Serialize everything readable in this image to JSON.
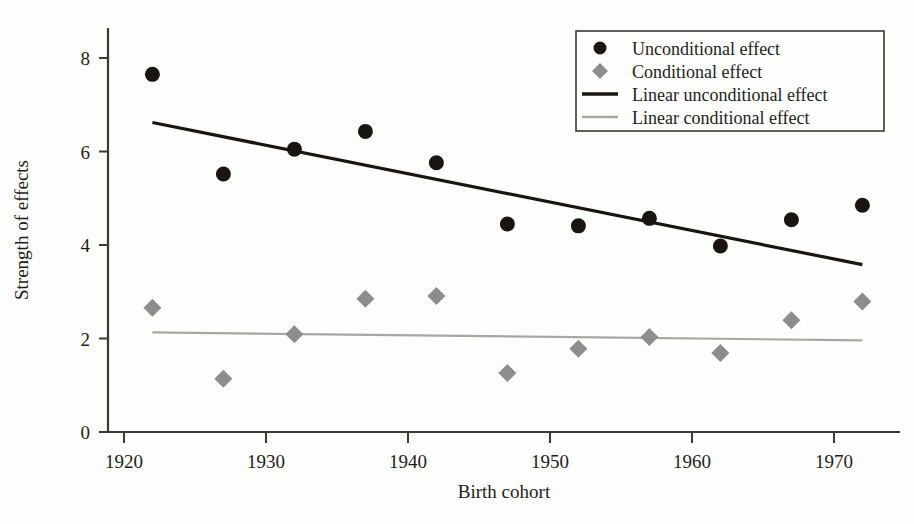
{
  "chart_data": {
    "type": "scatter",
    "title": "",
    "xlabel": "Birth cohort",
    "ylabel": "Strength of effects",
    "xlim": [
      1917,
      1975
    ],
    "ylim": [
      0,
      8.9
    ],
    "xticks": [
      "1920",
      "1930",
      "1940",
      "1950",
      "1960",
      "1970"
    ],
    "xtick_values": [
      1920,
      1930,
      1940,
      1950,
      1960,
      1970
    ],
    "yticks": [
      "0",
      "2",
      "4",
      "6",
      "8"
    ],
    "ytick_values": [
      0,
      2,
      4,
      6,
      8
    ],
    "grid": false,
    "legend_position": "top-right",
    "x": [
      1922,
      1927,
      1932,
      1937,
      1942,
      1947,
      1952,
      1957,
      1962,
      1967,
      1972
    ],
    "series": [
      {
        "name": "Unconditional effect",
        "marker": "circle",
        "color": "#1a1412",
        "values": [
          7.65,
          5.52,
          6.05,
          6.43,
          5.76,
          4.45,
          4.41,
          4.57,
          3.98,
          4.54,
          4.85
        ]
      },
      {
        "name": "Conditional effect",
        "marker": "diamond",
        "color": "#8d8d8d",
        "values": [
          2.66,
          1.14,
          2.09,
          2.85,
          2.91,
          1.26,
          1.78,
          2.03,
          1.69,
          2.39,
          2.79
        ]
      }
    ],
    "trendlines": [
      {
        "name": "Linear unconditional effect",
        "color": "#1a1412",
        "x0": 1922,
        "y0": 6.62,
        "x1": 1972,
        "y1": 3.58
      },
      {
        "name": "Linear conditional effect",
        "color": "#a7a7a2",
        "x0": 1922,
        "y0": 2.13,
        "x1": 1972,
        "y1": 1.96
      }
    ]
  },
  "legend": {
    "entries": [
      {
        "label": "Unconditional effect",
        "type": "circle",
        "color": "#1a1412"
      },
      {
        "label": "Conditional effect",
        "type": "diamond",
        "color": "#8d8d8d"
      },
      {
        "label": "Linear unconditional effect",
        "type": "line",
        "color": "#1a1412"
      },
      {
        "label": "Linear conditional effect",
        "type": "line",
        "color": "#a7a7a2"
      }
    ]
  },
  "colors": {
    "background": "#fdfdfb",
    "axis": "#3a3a35",
    "unconditional": "#1a1412",
    "conditional": "#8d8d8d",
    "linear_conditional": "#a7a7a2"
  }
}
